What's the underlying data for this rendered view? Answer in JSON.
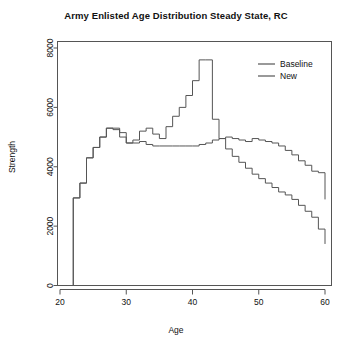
{
  "chart_data": {
    "type": "line",
    "title": "Army Enlisted Age Distribution Steady State, RC",
    "xlabel": "Age",
    "ylabel": "Strength",
    "xlim": [
      20,
      60
    ],
    "ylim": [
      0,
      8000
    ],
    "xticks": [
      20,
      30,
      40,
      50,
      60
    ],
    "yticks": [
      0,
      2000,
      4000,
      6000,
      8000
    ],
    "grid": false,
    "legend_position": "top-right",
    "line_style": "step",
    "x": [
      21,
      22,
      23,
      24,
      25,
      26,
      27,
      28,
      29,
      30,
      31,
      32,
      33,
      34,
      35,
      36,
      37,
      38,
      39,
      40,
      41,
      42,
      43,
      44,
      45,
      46,
      47,
      48,
      49,
      50,
      51,
      52,
      53,
      54,
      55,
      56,
      57,
      58,
      59,
      60
    ],
    "series": [
      {
        "name": "Baseline",
        "color": "#555555",
        "values": [
          0,
          2950,
          3450,
          4300,
          4650,
          5000,
          5300,
          5300,
          5150,
          4800,
          4800,
          4850,
          4750,
          4700,
          4700,
          4700,
          4700,
          4700,
          4700,
          4700,
          4750,
          4800,
          4900,
          4950,
          5000,
          4950,
          4900,
          4850,
          4950,
          4900,
          4850,
          4800,
          4700,
          4550,
          4400,
          4200,
          4050,
          3850,
          3800,
          2900
        ]
      },
      {
        "name": "New",
        "color": "#555555",
        "values": [
          0,
          2950,
          3450,
          4300,
          4650,
          5000,
          5300,
          5250,
          5000,
          4800,
          4900,
          5200,
          5300,
          5100,
          4950,
          5350,
          5700,
          6000,
          6400,
          6900,
          7600,
          7600,
          5600,
          4950,
          4600,
          4350,
          4150,
          3950,
          3750,
          3600,
          3450,
          3300,
          3150,
          3050,
          2900,
          2700,
          2500,
          2300,
          1900,
          1400
        ]
      }
    ]
  },
  "legend": {
    "items": [
      {
        "label": "Baseline"
      },
      {
        "label": "New"
      }
    ]
  },
  "axes": {
    "x_tick_labels": [
      "20",
      "30",
      "40",
      "50",
      "60"
    ],
    "y_tick_labels": [
      "0",
      "2000",
      "4000",
      "6000",
      "8000"
    ]
  }
}
